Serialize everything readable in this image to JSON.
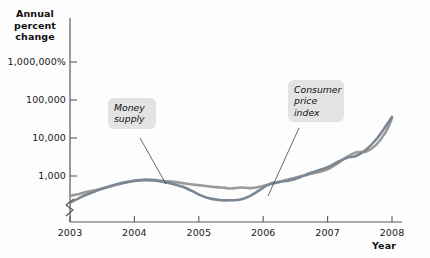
{
  "chart_data": {
    "type": "line",
    "title": "",
    "ylabel": "Annual percent change",
    "xlabel": "Year",
    "y_scale": "log",
    "y_axis_break": true,
    "grid": false,
    "legend_position": "inline-callouts",
    "ytick_labels": [
      "1,000,000%",
      "100,000",
      "10,000",
      "1,000"
    ],
    "ytick_values": [
      1000000,
      100000,
      10000,
      1000
    ],
    "xtick_labels": [
      "2003",
      "2004",
      "2005",
      "2006",
      "2007",
      "2008"
    ],
    "xlim": [
      2003,
      2008
    ],
    "ylim": [
      100,
      3000000
    ],
    "annotations": [
      {
        "name": "money-supply",
        "text": "Money\nsupply"
      },
      {
        "name": "consumer-price-index",
        "text": "Consumer\nprice\nindex"
      }
    ],
    "series": [
      {
        "name": "Money supply",
        "color": "#9a9a9a",
        "x": [
          2003.0,
          2003.12,
          2003.25,
          2003.4,
          2003.55,
          2003.7,
          2003.85,
          2004.0,
          2004.15,
          2004.3,
          2004.45,
          2004.6,
          2004.75,
          2004.9,
          2005.05,
          2005.2,
          2005.35,
          2005.5,
          2005.65,
          2005.8,
          2005.95,
          2006.1,
          2006.25,
          2006.4,
          2006.55,
          2006.7,
          2006.85,
          2007.0,
          2007.15,
          2007.3,
          2007.45,
          2007.6,
          2007.75,
          2007.9,
          2008.0
        ],
        "values": [
          300,
          330,
          380,
          430,
          500,
          590,
          680,
          760,
          800,
          790,
          740,
          700,
          650,
          600,
          560,
          520,
          500,
          470,
          500,
          480,
          520,
          600,
          700,
          820,
          950,
          1100,
          1250,
          1500,
          2100,
          3200,
          4200,
          4400,
          6500,
          14000,
          33000
        ]
      },
      {
        "name": "Consumer price index",
        "color": "#7b8694",
        "x": [
          2003.0,
          2003.12,
          2003.25,
          2003.4,
          2003.55,
          2003.7,
          2003.85,
          2004.0,
          2004.15,
          2004.3,
          2004.45,
          2004.6,
          2004.75,
          2004.9,
          2005.05,
          2005.2,
          2005.35,
          2005.5,
          2005.65,
          2005.8,
          2005.95,
          2006.1,
          2006.25,
          2006.4,
          2006.55,
          2006.7,
          2006.85,
          2007.0,
          2007.15,
          2007.3,
          2007.45,
          2007.6,
          2007.75,
          2007.9,
          2008.0
        ],
        "values": [
          200,
          250,
          320,
          400,
          490,
          580,
          670,
          740,
          780,
          760,
          700,
          620,
          520,
          400,
          300,
          250,
          230,
          230,
          240,
          300,
          430,
          620,
          700,
          760,
          900,
          1150,
          1400,
          1700,
          2300,
          3000,
          3400,
          5000,
          9000,
          20000,
          36000
        ]
      }
    ]
  },
  "labels": {
    "y_axis_title": "Annual\npercent\nchange",
    "x_axis_title": "Year",
    "money_supply": "Money\nsupply",
    "consumer_price_index": "Consumer\nprice\nindex"
  },
  "colors": {
    "money_supply_line": "#9a9a9a",
    "cpi_line": "#7b8694",
    "axis": "#5a5a5a",
    "text": "#111111",
    "callout_bg": "#e3e3e3",
    "background": "#fdfdfd"
  }
}
